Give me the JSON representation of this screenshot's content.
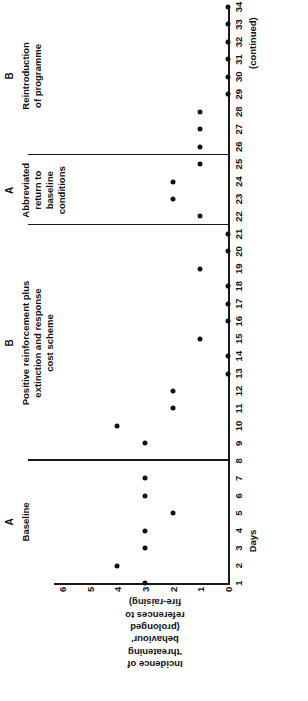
{
  "figure": {
    "continued_note": "(continued)"
  },
  "chart_data": {
    "type": "scatter",
    "title": "",
    "xlabel": "Days",
    "ylabel": "Incidence of 'threatening behaviour' (prolonged references to fire-raising)",
    "ylabel_lines": [
      "Incidence of",
      "'threatening",
      "behaviour'",
      "(prolonged",
      "references to",
      "fire-raising)"
    ],
    "xlim": [
      1,
      34
    ],
    "ylim": [
      0,
      6
    ],
    "grid": false,
    "legend": "none",
    "xticks": [
      1,
      2,
      3,
      4,
      5,
      6,
      7,
      8,
      9,
      10,
      11,
      12,
      13,
      14,
      15,
      16,
      17,
      18,
      19,
      20,
      21,
      22,
      23,
      24,
      25,
      26,
      27,
      28,
      29,
      30,
      31,
      32,
      33,
      34
    ],
    "xtick_labels": [
      "1",
      "2",
      "3",
      "4",
      "5",
      "6",
      "7",
      "8",
      "9",
      "10",
      "11",
      "12",
      "13",
      "14",
      "15",
      "16",
      "17",
      "18",
      "19",
      "20",
      "21",
      "22",
      "23",
      "24",
      "25",
      "26",
      "27",
      "28",
      "29",
      "30",
      "31",
      "32",
      "33",
      "34"
    ],
    "yticks": [
      0,
      1,
      2,
      3,
      4,
      5,
      6
    ],
    "ytick_labels": [
      "0",
      "1",
      "2",
      "3",
      "4",
      "5",
      "6"
    ],
    "x": [
      1,
      2,
      3,
      4,
      5,
      6,
      7,
      9,
      10,
      11,
      12,
      13,
      14,
      15,
      16,
      17,
      18,
      19,
      20,
      21,
      22,
      23,
      24,
      25,
      26,
      27,
      28,
      29,
      30,
      31,
      32,
      33,
      34
    ],
    "y": [
      3,
      4,
      3,
      3,
      2,
      3,
      3,
      3,
      4,
      2,
      2,
      0,
      0,
      1,
      0,
      0,
      0,
      1,
      0,
      0,
      1,
      2,
      2,
      1,
      1,
      1,
      1,
      0,
      0,
      0,
      0,
      0,
      0
    ],
    "points": [
      {
        "day": 1,
        "value": 3
      },
      {
        "day": 2,
        "value": 4
      },
      {
        "day": 3,
        "value": 3
      },
      {
        "day": 4,
        "value": 3
      },
      {
        "day": 5,
        "value": 2
      },
      {
        "day": 6,
        "value": 3
      },
      {
        "day": 7,
        "value": 3
      },
      {
        "day": 9,
        "value": 3
      },
      {
        "day": 10,
        "value": 4
      },
      {
        "day": 11,
        "value": 2
      },
      {
        "day": 12,
        "value": 2
      },
      {
        "day": 13,
        "value": 0
      },
      {
        "day": 14,
        "value": 0
      },
      {
        "day": 15,
        "value": 1
      },
      {
        "day": 16,
        "value": 0
      },
      {
        "day": 17,
        "value": 0
      },
      {
        "day": 18,
        "value": 0
      },
      {
        "day": 19,
        "value": 1
      },
      {
        "day": 20,
        "value": 0
      },
      {
        "day": 21,
        "value": 0
      },
      {
        "day": 22,
        "value": 1
      },
      {
        "day": 23,
        "value": 2
      },
      {
        "day": 24,
        "value": 2
      },
      {
        "day": 25,
        "value": 1
      },
      {
        "day": 26,
        "value": 1
      },
      {
        "day": 27,
        "value": 1
      },
      {
        "day": 28,
        "value": 1
      },
      {
        "day": 29,
        "value": 0
      },
      {
        "day": 30,
        "value": 0
      },
      {
        "day": 31,
        "value": 0
      },
      {
        "day": 32,
        "value": 0
      },
      {
        "day": 33,
        "value": 0
      },
      {
        "day": 34,
        "value": 0
      }
    ],
    "phases": [
      {
        "letter": "A",
        "caption_lines": [
          "Baseline"
        ],
        "start_day": 1,
        "end_day": 8
      },
      {
        "letter": "B",
        "caption_lines": [
          "Positive reinforcement plus",
          "extinction and response",
          "cost scheme"
        ],
        "start_day": 8,
        "end_day": 21.5
      },
      {
        "letter": "A",
        "caption_lines": [
          "Abbreviated",
          "return to",
          "baseline",
          "conditions"
        ],
        "start_day": 21.5,
        "end_day": 25.5
      },
      {
        "letter": "B",
        "caption_lines": [
          "Reintroduction",
          "of programme"
        ],
        "start_day": 25.5,
        "end_day": 34.6
      }
    ],
    "phase_dividers": [
      8,
      21.5,
      25.5
    ]
  }
}
